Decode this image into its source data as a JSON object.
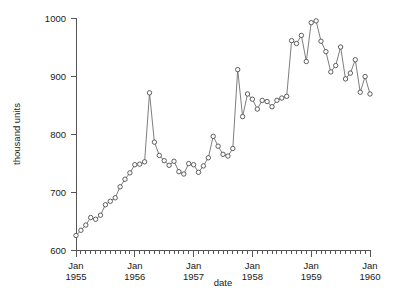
{
  "chart_data": {
    "type": "line",
    "title": "",
    "xlabel": "date",
    "ylabel": "thousand units",
    "ylim": [
      600,
      1000
    ],
    "xlim": [
      "1955-01",
      "1960-01"
    ],
    "grid": false,
    "legend": "none",
    "marker": "open-circle",
    "y_ticks": [
      600,
      700,
      800,
      900,
      1000
    ],
    "y_tick_labels": [
      "600",
      "700",
      "800",
      "900",
      "1000"
    ],
    "x_tick_labels": [
      {
        "line1": "Jan",
        "line2": "1955"
      },
      {
        "line1": "Jan",
        "line2": "1956"
      },
      {
        "line1": "Jan",
        "line2": "1957"
      },
      {
        "line1": "Jan",
        "line2": "1958"
      },
      {
        "line1": "Jan",
        "line2": "1959"
      },
      {
        "line1": "Jan",
        "line2": "1960"
      }
    ],
    "x_minor_ticks_per_year": 12,
    "series": [
      {
        "name": "thousand units",
        "x": [
          "1955-01",
          "1955-02",
          "1955-03",
          "1955-04",
          "1955-05",
          "1955-06",
          "1955-07",
          "1955-08",
          "1955-09",
          "1955-10",
          "1955-11",
          "1955-12",
          "1956-01",
          "1956-02",
          "1956-03",
          "1956-04",
          "1956-05",
          "1956-06",
          "1956-07",
          "1956-08",
          "1956-09",
          "1956-10",
          "1956-11",
          "1956-12",
          "1957-01",
          "1957-02",
          "1957-03",
          "1957-04",
          "1957-05",
          "1957-06",
          "1957-07",
          "1957-08",
          "1957-09",
          "1957-10",
          "1957-11",
          "1957-12",
          "1958-01",
          "1958-02",
          "1958-03",
          "1958-04",
          "1958-05",
          "1958-06",
          "1958-07",
          "1958-08",
          "1958-09",
          "1958-10",
          "1958-11",
          "1958-12",
          "1959-01",
          "1959-02",
          "1959-03",
          "1959-04",
          "1959-05",
          "1959-06",
          "1959-07",
          "1959-08",
          "1959-09",
          "1959-10",
          "1959-11",
          "1959-12",
          "1960-01"
        ],
        "values": [
          625,
          634,
          643,
          656,
          653,
          660,
          678,
          684,
          690,
          709,
          722,
          733,
          747,
          748,
          752,
          871,
          786,
          763,
          754,
          746,
          753,
          735,
          731,
          749,
          747,
          734,
          745,
          759,
          796,
          779,
          765,
          762,
          775,
          911,
          830,
          869,
          860,
          843,
          858,
          856,
          847,
          858,
          862,
          865,
          961,
          956,
          970,
          925,
          992,
          995,
          960,
          942,
          907,
          918,
          950,
          895,
          905,
          928,
          872,
          899,
          869
        ]
      }
    ]
  },
  "axes": {
    "y_title": "thousand units",
    "x_title": "date"
  }
}
